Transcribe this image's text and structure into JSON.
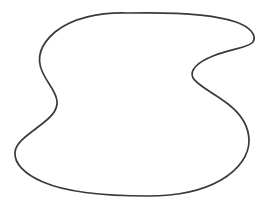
{
  "figure": {
    "name": "closed-curve-blob",
    "type": "line-drawing",
    "title": "",
    "caption": "",
    "background_color": "#ffffff",
    "stroke_color": "#3a3a3a",
    "fill_color": "#ffffff",
    "stroke_width": 1.7,
    "canvas": {
      "width": 269,
      "height": 215
    },
    "path": "M 128 13 C 100 12 72 18 55 32 C 41 44 36 57 42 71 C 47 83 56 91 57 101 C 58 111 50 118 38 127 C 26 136 16 143 15 152 C 14 163 24 174 43 182 C 66 192 105 196 148 196 C 176 196 202 191 221 180 C 240 169 249 154 249 141 C 249 127 241 114 228 104 C 214 93 198 86 193 78 C 189 70 198 62 213 56 C 230 49 248 48 253 42 C 257 35 250 27 236 22 C 216 15 176 12 128 13 Z",
    "extrema": {
      "topmost": {
        "x": 128,
        "y": 13
      },
      "bottommost": {
        "x": 156,
        "y": 196
      },
      "leftmost": {
        "x": 15,
        "y": 152
      },
      "rightmost": {
        "x": 253,
        "y": 43
      }
    },
    "features": [
      {
        "name": "right-notch-apex",
        "x": 193,
        "y": 78
      },
      {
        "name": "left-indent-apex",
        "x": 57,
        "y": 101
      },
      {
        "name": "upper-right-lobe",
        "x": 251,
        "y": 46
      },
      {
        "name": "lower-right-lobe",
        "x": 249,
        "y": 141
      },
      {
        "name": "upper-left-arc",
        "x": 40,
        "y": 62
      }
    ]
  }
}
